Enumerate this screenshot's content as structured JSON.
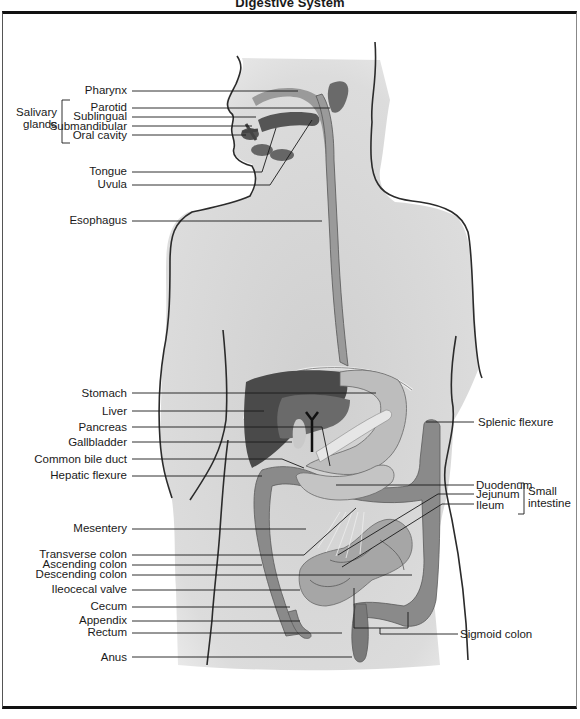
{
  "title": "Digestive System",
  "labels_left": [
    {
      "id": "pharynx",
      "text": "Pharynx",
      "y": 90
    },
    {
      "id": "parotid",
      "text": "Parotid",
      "y": 107
    },
    {
      "id": "sublingual",
      "text": "Sublingual",
      "y": 116
    },
    {
      "id": "submandibular",
      "text": "Submandibular",
      "y": 126
    },
    {
      "id": "oral-cavity",
      "text": "Oral cavity",
      "y": 135
    },
    {
      "id": "tongue",
      "text": "Tongue",
      "y": 171
    },
    {
      "id": "uvula",
      "text": "Uvula",
      "y": 184
    },
    {
      "id": "esophagus",
      "text": "Esophagus",
      "y": 220
    },
    {
      "id": "stomach",
      "text": "Stomach",
      "y": 393
    },
    {
      "id": "liver",
      "text": "Liver",
      "y": 411
    },
    {
      "id": "pancreas",
      "text": "Pancreas",
      "y": 427
    },
    {
      "id": "gallbladder",
      "text": "Gallbladder",
      "y": 442
    },
    {
      "id": "common-bile-duct",
      "text": "Common bile duct",
      "y": 459
    },
    {
      "id": "hepatic-flexure",
      "text": "Hepatic flexure",
      "y": 475
    },
    {
      "id": "mesentery",
      "text": "Mesentery",
      "y": 528
    },
    {
      "id": "transverse-colon",
      "text": "Transverse colon",
      "y": 554
    },
    {
      "id": "ascending-colon",
      "text": "Ascending colon",
      "y": 564
    },
    {
      "id": "descending-colon",
      "text": "Descending colon",
      "y": 574
    },
    {
      "id": "ileocecal-valve",
      "text": "Ileocecal valve",
      "y": 589
    },
    {
      "id": "cecum",
      "text": "Cecum",
      "y": 606
    },
    {
      "id": "appendix",
      "text": "Appendix",
      "y": 620
    },
    {
      "id": "rectum",
      "text": "Rectum",
      "y": 632
    },
    {
      "id": "anus",
      "text": "Anus",
      "y": 657
    }
  ],
  "group_left": {
    "text_line1": "Salivary",
    "text_line2": "glands"
  },
  "labels_right": [
    {
      "id": "splenic-flexure",
      "text": "Splenic flexure",
      "y": 422
    },
    {
      "id": "duodenum",
      "text": "Duodenum",
      "y": 485
    },
    {
      "id": "jejunum",
      "text": "Jejunum",
      "y": 494
    },
    {
      "id": "ileum",
      "text": "Ileum",
      "y": 506
    },
    {
      "id": "sigmoid-colon",
      "text": "Sigmoid colon",
      "y": 634
    }
  ],
  "group_right": {
    "text_line1": "Small",
    "text_line2": "intestine"
  },
  "colors": {
    "body": "#d9d9d9",
    "outline": "#2b2b2b",
    "organ_dark": "#5a5a5a",
    "organ_mid": "#8c8c8c",
    "organ_light": "#b8b8b8",
    "leader": "#1a1a1a"
  }
}
